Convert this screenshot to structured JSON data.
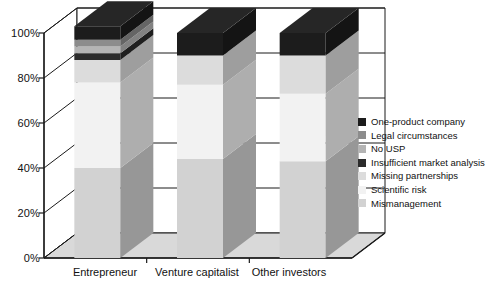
{
  "chart_data": {
    "type": "bar",
    "subtype": "stacked-100-percent-3d",
    "title": "",
    "xlabel": "",
    "ylabel": "",
    "ylim": [
      0,
      100
    ],
    "ytick_labels": [
      "0%",
      "20%",
      "40%",
      "60%",
      "80%",
      "100%"
    ],
    "ytick_values": [
      0,
      20,
      40,
      60,
      80,
      100
    ],
    "grid": true,
    "legend_position": "right",
    "categories": [
      "Entrepreneur",
      "Venture capitalist",
      "Other investors"
    ],
    "series": [
      {
        "name": "Mismanagement",
        "values": [
          40,
          44,
          43
        ],
        "color": "#d2d2d2"
      },
      {
        "name": "Scientific risk",
        "values": [
          38,
          33,
          30
        ],
        "color": "#f2f2f2"
      },
      {
        "name": "Missing partnerships",
        "values": [
          10,
          13,
          17
        ],
        "color": "#dcdcdc"
      },
      {
        "name": "Insufficient market analysis",
        "values": [
          3,
          0,
          0
        ],
        "color": "#2b2b2b"
      },
      {
        "name": "No USP",
        "values": [
          3,
          0,
          0
        ],
        "color": "#b4b4b4"
      },
      {
        "name": "Legal circumstances",
        "values": [
          3,
          0,
          0
        ],
        "color": "#8c8c8c"
      },
      {
        "name": "One-product company",
        "values": [
          6,
          10,
          10
        ],
        "color": "#1c1c1c"
      }
    ]
  },
  "legend": {
    "items": [
      {
        "label": "One-product company",
        "color": "#1c1c1c"
      },
      {
        "label": "Legal circumstances",
        "color": "#8c8c8c"
      },
      {
        "label": "No USP",
        "color": "#b4b4b4"
      },
      {
        "label": "Insufficient market analysis",
        "color": "#2b2b2b"
      },
      {
        "label": "Missing partnerships",
        "color": "#dcdcdc"
      },
      {
        "label": "Scientific risk",
        "color": "#f2f2f2"
      },
      {
        "label": "Mismanagement",
        "color": "#d2d2d2"
      }
    ]
  },
  "axis": {
    "y_labels": [
      "100%",
      "80%",
      "60%",
      "40%",
      "20%",
      "0%"
    ],
    "x_labels": [
      "Entrepreneur",
      "Venture capitalist",
      "Other investors"
    ]
  }
}
